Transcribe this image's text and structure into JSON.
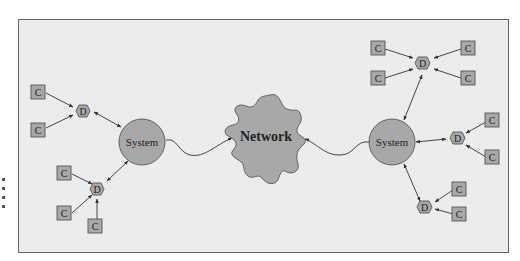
{
  "diagram": {
    "network_label": "Network",
    "system_label": "System",
    "device_label": "D",
    "client_label": "C",
    "colors": {
      "background": "#ececec",
      "frame": "#666666",
      "node_fill": "#a8a8a8",
      "node_stroke": "#555555",
      "edge": "#333333"
    },
    "left_system": {
      "label": "System",
      "devices": [
        {
          "label": "D",
          "clients": [
            "C",
            "C"
          ]
        },
        {
          "label": "D",
          "clients": [
            "C",
            "C",
            "C"
          ]
        }
      ]
    },
    "right_system": {
      "label": "System",
      "devices": [
        {
          "label": "D",
          "clients": [
            "C",
            "C",
            "C",
            "C"
          ]
        },
        {
          "label": "D",
          "clients": [
            "C",
            "C"
          ]
        },
        {
          "label": "D",
          "clients": [
            "C",
            "C"
          ]
        }
      ]
    }
  }
}
